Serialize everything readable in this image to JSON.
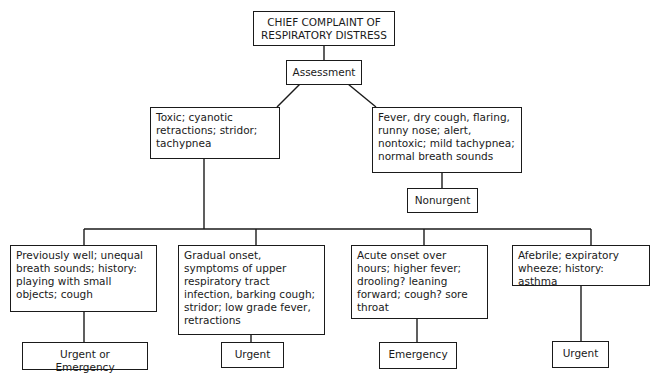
{
  "diagram": {
    "root": {
      "line1": "CHIEF COMPLAINT OF",
      "line2": "RESPIRATORY DISTRESS"
    },
    "assessment": "Assessment",
    "branches": {
      "toxic": {
        "text": "Toxic; cyanotic retractions; stridor; tachypnea"
      },
      "nontoxic": {
        "text": "Fever, dry cough, flaring, runny nose; alert, nontoxic; mild tachypnea; normal breath sounds",
        "outcome": "Nonurgent"
      }
    },
    "toxic_subtypes": [
      {
        "text": "Previously well; unequal breath sounds; history: playing with small objects; cough",
        "outcome": "Urgent or Emergency"
      },
      {
        "text": "Gradual onset, symptoms of upper respiratory tract infection, barking cough; stridor; low grade fever, retractions",
        "outcome": "Urgent"
      },
      {
        "text": "Acute onset over hours; higher fever; drooling? leaning forward; cough? sore throat",
        "outcome": "Emergency"
      },
      {
        "text": "Afebrile; expiratory wheeze; history: asthma",
        "outcome": "Urgent"
      }
    ]
  }
}
